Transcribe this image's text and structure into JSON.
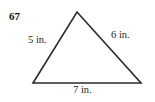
{
  "figure": {
    "problem_number": "67",
    "shape": "triangle",
    "background_color": "#ffffff",
    "stroke_color": "#2b2b2b",
    "label_color": "#1c1c1c",
    "units": "in.",
    "vertices": {
      "apex": {
        "x": 77,
        "y": 12
      },
      "bottom_left": {
        "x": 33,
        "y": 83
      },
      "bottom_right": {
        "x": 141,
        "y": 83
      }
    },
    "sides": [
      {
        "name": "left",
        "value": "5",
        "label": "5 in."
      },
      {
        "name": "right",
        "value": "6",
        "label": "6 in."
      },
      {
        "name": "base",
        "value": "7",
        "label": "7 in."
      }
    ]
  }
}
